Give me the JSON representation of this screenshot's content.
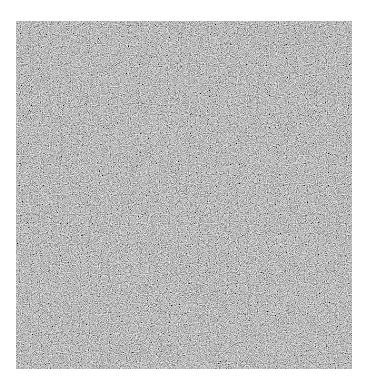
{
  "image": {
    "description": "Square grayscale random noise texture on white background",
    "background_color": "#ffffff",
    "noise_base_color": "#7a7a7a"
  }
}
